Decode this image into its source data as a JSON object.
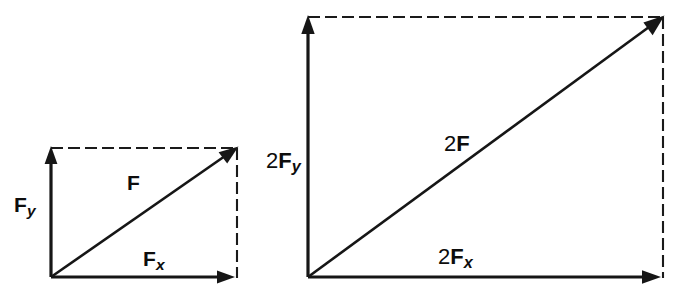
{
  "figure": {
    "type": "vector-decomposition-diagram",
    "background_color": "#ffffff",
    "stroke_color": "#161616",
    "panel_count": 2
  },
  "panels": [
    {
      "id": "panel-f",
      "name": "force-vector-f",
      "origin": {
        "x": 51,
        "y": 277
      },
      "corner": {
        "x": 237,
        "y": 148
      },
      "width": 186,
      "height": 129,
      "resultant": {
        "label_prefix": "",
        "label_symbol": "F",
        "label_subscript": "",
        "label_text": "F",
        "label_x": 127,
        "label_y": 172
      },
      "x_component": {
        "label_prefix": "",
        "label_symbol": "F",
        "label_subscript": "x",
        "label_text": "Fx",
        "label_x": 143,
        "label_y": 248
      },
      "y_component": {
        "label_prefix": "",
        "label_symbol": "F",
        "label_subscript": "y",
        "label_text": "Fy",
        "label_x": 14,
        "label_y": 194
      }
    },
    {
      "id": "panel-2f",
      "name": "force-vector-2f",
      "origin": {
        "x": 308,
        "y": 277
      },
      "corner": {
        "x": 663,
        "y": 17
      },
      "width": 355,
      "height": 260,
      "resultant": {
        "label_prefix": "2",
        "label_symbol": "F",
        "label_subscript": "",
        "label_text": "2F",
        "label_x": 444,
        "label_y": 133
      },
      "x_component": {
        "label_prefix": "2",
        "label_symbol": "F",
        "label_subscript": "x",
        "label_text": "2Fx",
        "label_x": 438,
        "label_y": 246
      },
      "y_component": {
        "label_prefix": "2",
        "label_symbol": "F",
        "label_subscript": "y",
        "label_text": "2Fy",
        "label_x": 266,
        "label_y": 150
      }
    }
  ]
}
